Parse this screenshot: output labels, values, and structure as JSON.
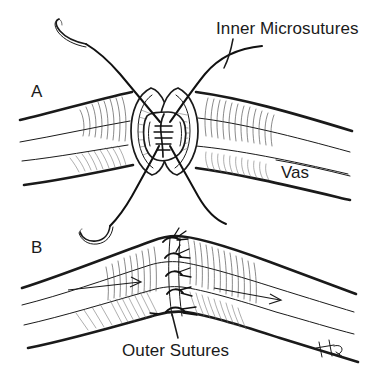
{
  "figure": {
    "background_color": "#ffffff",
    "ink_color": "#1a1a1a",
    "width": 372,
    "height": 379
  },
  "panels": [
    {
      "letter": "A",
      "description": "Cut ends of the vas deferens approximated; inner microsutures placed through the mucosa and lumen, with curved needles and suture tails exiting above and below.",
      "elements": [
        "curved-surgical-needle-upper-left",
        "curved-surgical-needle-lower-left",
        "vas-proximal-segment",
        "vas-distal-segment",
        "cut-end-face-left",
        "cut-end-face-right",
        "lumen-opening",
        "inner-microsuture-threads"
      ]
    },
    {
      "letter": "B",
      "description": "Completed anastomosis viewed from the exterior; interrupted outer seromuscular sutures close the muscularis over the inner layer. Arrows indicate luminal flow direction.",
      "elements": [
        "vas-tube",
        "outer-suture-knots",
        "flow-arrow-left",
        "flow-arrow-right",
        "artist-signature"
      ],
      "outer_suture_count": 5,
      "flow_arrows": 2
    }
  ],
  "labels": {
    "inner_microsutures": "Inner Microsutures",
    "outer_sutures": "Outer Sutures",
    "vas": "Vas",
    "panel_a": "A",
    "panel_b": "B"
  },
  "annotations": {
    "signature": "HG"
  }
}
